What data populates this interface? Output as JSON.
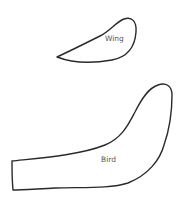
{
  "diagram": {
    "shapes": [
      {
        "id": "wing",
        "label": "Wing"
      },
      {
        "id": "bird",
        "label": "Bird"
      }
    ],
    "colors": {
      "stroke": "#2a2a2a",
      "label": "#555555",
      "background": "#ffffff"
    }
  }
}
